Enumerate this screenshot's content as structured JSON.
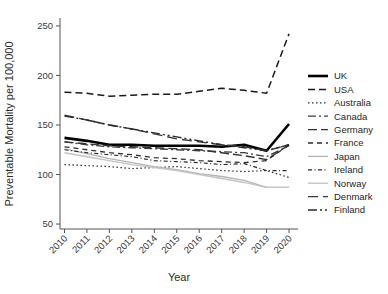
{
  "chart_data": {
    "type": "line",
    "title": "",
    "xlabel": "Year",
    "ylabel": "Preventable Mortality per 100,000",
    "x": [
      2010,
      2011,
      2012,
      2013,
      2014,
      2015,
      2016,
      2017,
      2018,
      2019,
      2020
    ],
    "xtick_labels": [
      "2010",
      "2011",
      "2012",
      "2013",
      "2014",
      "2015",
      "2016",
      "2017",
      "2018",
      "2019",
      "2020"
    ],
    "ytick_labels": [
      "50",
      "100",
      "150",
      "200",
      "250"
    ],
    "ytick_values": [
      50,
      100,
      150,
      200,
      250
    ],
    "ylim": [
      45,
      258
    ],
    "xlim": [
      2009.8,
      2020.4
    ],
    "grid": false,
    "legend_position": "right",
    "series": [
      {
        "name": "UK",
        "color": "#000000",
        "width": 2.6,
        "dash": "none",
        "values": [
          137,
          134,
          130,
          130,
          129,
          129,
          129,
          128,
          130,
          124,
          151
        ]
      },
      {
        "name": "USA",
        "color": "#1a1a1a",
        "width": 1.5,
        "dash": "7,4",
        "values": [
          183,
          182,
          179,
          180,
          181,
          181,
          184,
          187,
          185,
          182,
          242
        ]
      },
      {
        "name": "Australia",
        "color": "#2b2b2b",
        "width": 1.2,
        "dash": "1.5,2.5",
        "values": [
          110,
          109,
          108,
          106,
          107,
          108,
          106,
          104,
          103,
          104,
          97
        ]
      },
      {
        "name": "Canada",
        "color": "#3a3a3a",
        "width": 1.3,
        "dash": "8,3,2,3",
        "values": [
          133,
          130,
          128,
          127,
          126,
          125,
          124,
          123,
          122,
          118,
          129
        ]
      },
      {
        "name": "Germany",
        "color": "#333333",
        "width": 1.4,
        "dash": "9,4",
        "values": [
          133,
          131,
          129,
          128,
          127,
          126,
          125,
          122,
          119,
          115,
          130
        ]
      },
      {
        "name": "France",
        "color": "#2e2e2e",
        "width": 1.3,
        "dash": "5,4",
        "values": [
          128,
          125,
          122,
          120,
          117,
          116,
          114,
          113,
          112,
          114,
          130
        ]
      },
      {
        "name": "Japan",
        "color": "#b4b4b4",
        "width": 1.3,
        "dash": "none",
        "values": [
          126,
          121,
          116,
          112,
          108,
          105,
          101,
          98,
          94,
          87,
          87
        ]
      },
      {
        "name": "Ireland",
        "color": "#2b2b2b",
        "width": 1.2,
        "dash": "4,2.5,1,2.5",
        "values": [
          125,
          122,
          120,
          118,
          114,
          113,
          112,
          110,
          111,
          104,
          104
        ]
      },
      {
        "name": "Norway",
        "color": "#c4c4c4",
        "width": 1.4,
        "dash": "none",
        "values": [
          122,
          118,
          114,
          110,
          107,
          104,
          100,
          96,
          92,
          87,
          87
        ]
      },
      {
        "name": "Denmark",
        "color": "#3a3a3a",
        "width": 1.4,
        "dash": "10,5",
        "values": [
          160,
          155,
          150,
          146,
          141,
          136,
          133,
          130,
          128,
          124,
          130
        ]
      },
      {
        "name": "Finland",
        "color": "#2b2b2b",
        "width": 1.4,
        "dash": "9,3,2,3,2,3",
        "values": [
          159,
          155,
          150,
          146,
          142,
          138,
          134,
          130,
          127,
          124,
          130
        ]
      }
    ]
  },
  "axes": {
    "y_title": "Preventable Mortality per 100,000",
    "x_title": "Year"
  },
  "legend": {
    "items": [
      {
        "label": "UK"
      },
      {
        "label": "USA"
      },
      {
        "label": "Australia"
      },
      {
        "label": "Canada"
      },
      {
        "label": "Germany"
      },
      {
        "label": "France"
      },
      {
        "label": "Japan"
      },
      {
        "label": "Ireland"
      },
      {
        "label": "Norway"
      },
      {
        "label": "Denmark"
      },
      {
        "label": "Finland"
      }
    ]
  }
}
